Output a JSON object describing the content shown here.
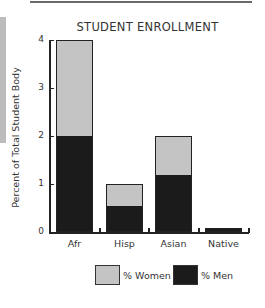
{
  "chart_data": {
    "type": "bar",
    "stacked": true,
    "title": "STUDENT ENROLLMENT",
    "xlabel": "",
    "ylabel": "Percent of Total Student Body",
    "categories": [
      "Afr",
      "Hisp",
      "Asian",
      "Native"
    ],
    "series": [
      {
        "name": "% Men",
        "color": "#1b1b1b",
        "values": [
          2.0,
          0.55,
          1.2,
          0.08
        ]
      },
      {
        "name": "% Women",
        "color": "#c4c4c4",
        "values": [
          2.0,
          0.45,
          0.8,
          0.0
        ]
      }
    ],
    "totals": [
      4.0,
      1.0,
      2.0,
      0.08
    ],
    "ylim": [
      0,
      4
    ],
    "yticks": [
      0,
      1,
      2,
      3,
      4
    ],
    "grid": false,
    "legend_position": "bottom"
  },
  "legend": {
    "women_label": "% Women",
    "men_label": "% Men"
  }
}
